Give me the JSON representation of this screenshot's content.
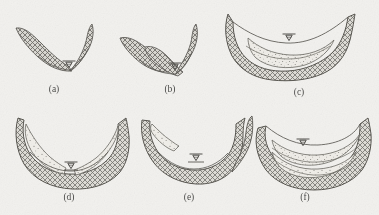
{
  "figure": {
    "kind": "scanned-line-drawing",
    "background_color": "#f2f1ee",
    "ink_color": "#55534f",
    "bedrock_fill_color": "#8c8a85",
    "sediment_fill_color": "#e6e4df",
    "panel_count": 6
  },
  "panels": [
    {
      "id": "a",
      "caption": "(a)",
      "caption_x": 47,
      "caption_y": 84,
      "description": "narrow V-shaped bedrock valley, asymmetric walls, thin channel at base",
      "has_water_table": true,
      "has_sediment_fill": false,
      "has_layered_fill": false
    },
    {
      "id": "b",
      "caption": "(b)",
      "caption_x": 163,
      "caption_y": 84,
      "description": "widened bedrock valley with benched left wall, water surface at base",
      "has_water_table": true,
      "has_sediment_fill": false,
      "has_layered_fill": false
    },
    {
      "id": "c",
      "caption": "(c)",
      "caption_x": 292,
      "caption_y": 86,
      "description": "broad bedrock valley partly backfilled with stippled sediment, water table at centre",
      "has_water_table": true,
      "has_sediment_fill": true,
      "has_layered_fill": false
    },
    {
      "id": "d",
      "caption": "(d)",
      "caption_x": 62,
      "caption_y": 192,
      "description": "deep U-shaped bedrock valley with thick stippled terrace wedges on both walls",
      "has_water_table": true,
      "has_sediment_fill": true,
      "has_layered_fill": false
    },
    {
      "id": "e",
      "caption": "(e)",
      "caption_x": 182,
      "caption_y": 192,
      "description": "re-incised bedrock valley, sediment remnant preserved on the left wall only",
      "has_water_table": true,
      "has_sediment_fill": true,
      "has_layered_fill": false
    },
    {
      "id": "f",
      "caption": "(f)",
      "caption_x": 298,
      "caption_y": 192,
      "description": "bedrock valley filled with stacked stippled sediment layers separated by bounding surfaces",
      "has_water_table": true,
      "has_sediment_fill": true,
      "has_layered_fill": true
    }
  ],
  "symbols": {
    "water_table": "inverted-triangle-on-line",
    "bedrock_pattern": "cross-hatch",
    "sediment_pattern": "stipple"
  }
}
